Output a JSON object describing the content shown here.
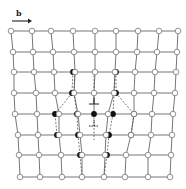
{
  "figure": {
    "burgers_label": "b",
    "colors": {
      "line": "#666666",
      "node_fill": "#ffffff",
      "node_stroke": "#777777",
      "defect_fill": "#111111",
      "dash": "#444444"
    },
    "rows": [
      {
        "y": 31,
        "nodes": [
          {
            "x": 11
          },
          {
            "x": 32
          },
          {
            "x": 51
          },
          {
            "x": 73
          },
          {
            "x": 95
          },
          {
            "x": 116
          },
          {
            "x": 138
          },
          {
            "x": 159
          },
          {
            "x": 178
          }
        ]
      },
      {
        "y": 52,
        "nodes": [
          {
            "x": 13
          },
          {
            "x": 33
          },
          {
            "x": 53
          },
          {
            "x": 74
          },
          {
            "x": 95
          },
          {
            "x": 116
          },
          {
            "x": 137
          },
          {
            "x": 157
          },
          {
            "x": 177
          }
        ]
      },
      {
        "y": 72,
        "nodes": [
          {
            "x": 14
          },
          {
            "x": 34
          },
          {
            "x": 54
          },
          {
            "x": 75,
            "b": 73
          },
          {
            "x": 95
          },
          {
            "x": 115,
            "b": 116
          },
          {
            "x": 135
          },
          {
            "x": 155
          },
          {
            "x": 176
          }
        ]
      },
      {
        "y": 93,
        "nodes": [
          {
            "x": 14
          },
          {
            "x": 36
          },
          {
            "x": 55
          },
          {
            "x": 74,
            "b": 72
          },
          {
            "x": 94
          },
          {
            "x": 114,
            "b": 116
          },
          {
            "x": 134
          },
          {
            "x": 154
          },
          {
            "x": 175
          }
        ]
      },
      {
        "y": 114,
        "nodes": [
          {
            "x": 15
          },
          {
            "x": 37
          },
          {
            "x": 59,
            "b": 55
          },
          {
            "x": 78,
            "b": 77
          },
          {
            "x": 94,
            "b": 94,
            "solid": true
          },
          {
            "x": 108,
            "b": 113
          },
          {
            "x": 134,
            "b": 134
          },
          {
            "x": 152
          },
          {
            "x": 173
          }
        ]
      },
      {
        "y": 135,
        "nodes": [
          {
            "x": 18
          },
          {
            "x": 38
          },
          {
            "x": 59,
            "b": 57
          },
          {
            "x": 80,
            "b": 78
          },
          {
            "x": 106,
            "b": 109
          },
          {
            "x": 131,
            "b": 131
          },
          {
            "x": 151
          },
          {
            "x": 172
          }
        ]
      },
      {
        "y": 155,
        "nodes": [
          {
            "x": 19
          },
          {
            "x": 39
          },
          {
            "x": 61
          },
          {
            "x": 82,
            "b": 80
          },
          {
            "x": 105,
            "b": 107
          },
          {
            "x": 126
          },
          {
            "x": 148
          },
          {
            "x": 171
          }
        ]
      },
      {
        "y": 177,
        "nodes": [
          {
            "x": 20
          },
          {
            "x": 40
          },
          {
            "x": 62
          },
          {
            "x": 82
          },
          {
            "x": 104
          },
          {
            "x": 125
          },
          {
            "x": 148
          },
          {
            "x": 170
          }
        ]
      }
    ],
    "dislocations": [
      {
        "x": 94,
        "y": 104,
        "type": "edge-up",
        "style": "solid"
      },
      {
        "x": 94,
        "y": 126,
        "type": "edge-up",
        "style": "dashed"
      }
    ]
  }
}
